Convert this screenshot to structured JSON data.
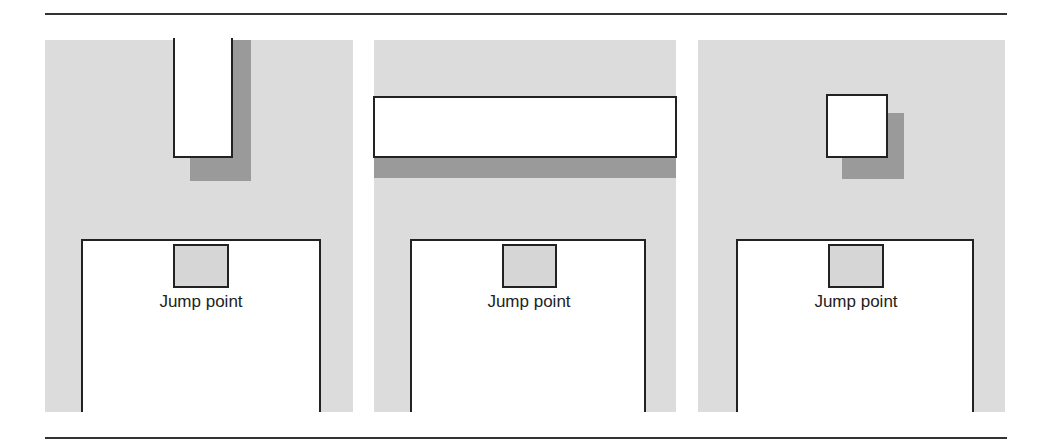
{
  "figure": {
    "panels": [
      {
        "id": "vertical-bar",
        "label": "Jump point",
        "obstacle": "vertical bar"
      },
      {
        "id": "horizontal-bar",
        "label": "Jump point",
        "obstacle": "horizontal bar"
      },
      {
        "id": "square",
        "label": "Jump point",
        "obstacle": "square"
      }
    ],
    "colors": {
      "panel_bg": "#dcdcdc",
      "shadow": "#9a9a9a",
      "outline": "#222222",
      "rule": "#333333"
    }
  }
}
